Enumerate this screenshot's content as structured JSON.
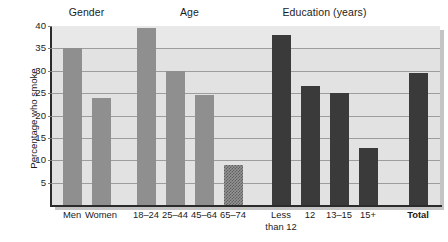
{
  "chart_data": {
    "type": "bar",
    "title": "",
    "xlabel": "",
    "ylabel": "Percentage who smoke",
    "ylim": [
      0,
      40
    ],
    "yticks": [
      5,
      10,
      15,
      20,
      25,
      30,
      35,
      40
    ],
    "grid": true,
    "legend": "none",
    "group_headers": [
      {
        "label": "Gender"
      },
      {
        "label": "Age"
      },
      {
        "label": "Education (years)"
      }
    ],
    "categories": [
      "Men",
      "Women",
      "18–24",
      "25–44",
      "45–64",
      "65–74",
      "Less than 12",
      "12",
      "13–15",
      "15+",
      "Total"
    ],
    "values": [
      35,
      24,
      39.5,
      30,
      24.5,
      9,
      38,
      26.5,
      25,
      12.7,
      29.5
    ],
    "bars": [
      {
        "category": "Men",
        "label_line1": "Men",
        "label_line2": "",
        "value": 35,
        "group": "Gender",
        "style": "light",
        "bold_label": false
      },
      {
        "category": "Women",
        "label_line1": "Women",
        "label_line2": "",
        "value": 24,
        "group": "Gender",
        "style": "light",
        "bold_label": false
      },
      {
        "category": "18-24",
        "label_line1": "18–24",
        "label_line2": "",
        "value": 39.5,
        "group": "Age",
        "style": "light",
        "bold_label": false
      },
      {
        "category": "25-44",
        "label_line1": "25–44",
        "label_line2": "",
        "value": 30,
        "group": "Age",
        "style": "light",
        "bold_label": false
      },
      {
        "category": "45-64",
        "label_line1": "45–64",
        "label_line2": "",
        "value": 24.5,
        "group": "Age",
        "style": "light",
        "bold_label": false
      },
      {
        "category": "65-74",
        "label_line1": "65–74",
        "label_line2": "",
        "value": 9,
        "group": "Age",
        "style": "hatched",
        "bold_label": false
      },
      {
        "category": "Less than 12",
        "label_line1": "Less",
        "label_line2": "than 12",
        "value": 38,
        "group": "Education (years)",
        "style": "dark",
        "bold_label": false
      },
      {
        "category": "12",
        "label_line1": "12",
        "label_line2": "",
        "value": 26.5,
        "group": "Education (years)",
        "style": "dark",
        "bold_label": false
      },
      {
        "category": "13-15",
        "label_line1": "13–15",
        "label_line2": "",
        "value": 25,
        "group": "Education (years)",
        "style": "dark",
        "bold_label": false
      },
      {
        "category": "15+",
        "label_line1": "15+",
        "label_line2": "",
        "value": 12.7,
        "group": "Education (years)",
        "style": "dark",
        "bold_label": false
      },
      {
        "category": "Total",
        "label_line1": "Total",
        "label_line2": "",
        "value": 29.5,
        "group": "Total",
        "style": "dark",
        "bold_label": true
      }
    ],
    "colors": {
      "bar_light": "#8f8f8f",
      "bar_dark": "#3a3a3a",
      "bar_hatched": "#949494",
      "plot_background": "#e2e2e2",
      "gridline": "#9d9d9d",
      "axis": "#2b2b2b",
      "text": "#1b1b1b"
    }
  }
}
